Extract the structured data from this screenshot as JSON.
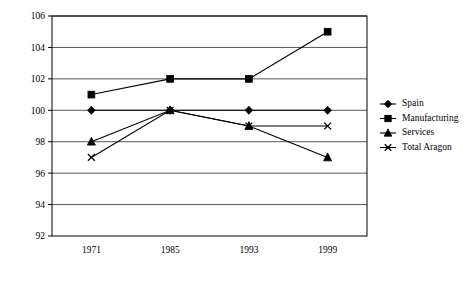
{
  "chart_data": {
    "type": "line",
    "title": "",
    "subtitle": "",
    "xlabel": "",
    "ylabel": "",
    "categories": [
      "1971",
      "1985",
      "1993",
      "1999"
    ],
    "x_tick_labels": [
      "1971",
      "1985",
      "1993",
      "1999"
    ],
    "y_tick_labels": [
      "92",
      "94",
      "96",
      "98",
      "100",
      "102",
      "104",
      "106"
    ],
    "ylim": [
      92,
      106
    ],
    "y_tick_step": 2,
    "grid": true,
    "grid_axis": "y",
    "legend_position": "right",
    "series": [
      {
        "name": "Spain",
        "marker": "diamond",
        "color": "#000000",
        "values": [
          100,
          100,
          100,
          100
        ]
      },
      {
        "name": "Manufacturing",
        "marker": "square",
        "color": "#000000",
        "values": [
          101,
          102,
          102,
          105
        ]
      },
      {
        "name": "Services",
        "marker": "triangle",
        "color": "#000000",
        "values": [
          98,
          100,
          99,
          97
        ]
      },
      {
        "name": "Total Aragon",
        "marker": "cross",
        "color": "#000000",
        "values": [
          97,
          100,
          99,
          99
        ]
      }
    ],
    "legend_entries": [
      {
        "label": "Spain",
        "marker": "diamond"
      },
      {
        "label": "Manufacturing",
        "marker": "square"
      },
      {
        "label": "Services",
        "marker": "triangle"
      },
      {
        "label": "Total Aragon",
        "marker": "cross"
      }
    ]
  },
  "colors": {
    "ink": "#000000",
    "grid": "#444444",
    "background": "#ffffff"
  }
}
